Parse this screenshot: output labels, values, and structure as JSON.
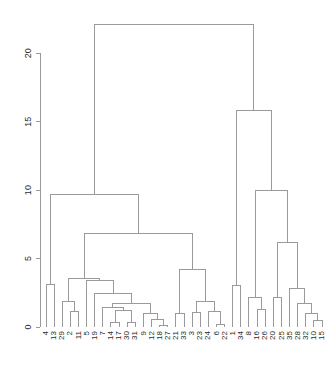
{
  "chart_data": {
    "type": "dendrogram",
    "title": "",
    "subtitle": "",
    "xlabel": "",
    "ylabel": "",
    "grid": false,
    "legend": "none",
    "ylim": [
      0,
      22.5
    ],
    "yticks": [
      0,
      5,
      10,
      15,
      20
    ],
    "ytick_labels": [
      "0",
      "5",
      "10",
      "15",
      "20"
    ],
    "axis_side": "left",
    "label_rotation": -90,
    "line_color": "#9a9a9a",
    "text_color": "#2b2b2b",
    "background": "#ffffff",
    "n_leaves": 35,
    "leaf_order": [
      4,
      13,
      29,
      2,
      11,
      5,
      19,
      7,
      14,
      17,
      30,
      31,
      9,
      12,
      18,
      27,
      21,
      33,
      3,
      23,
      24,
      6,
      22,
      1,
      34,
      8,
      16,
      26,
      20,
      25,
      35,
      28,
      32,
      10,
      15
    ],
    "leaf_labels": [
      "4",
      "13",
      "29",
      "2",
      "11",
      "5",
      "19",
      "7",
      "14",
      "17",
      "30",
      "31",
      "9",
      "12",
      "18",
      "27",
      "21",
      "33",
      "3",
      "23",
      "24",
      "6",
      "22",
      "1",
      "34",
      "8",
      "16",
      "26",
      "20",
      "25",
      "35",
      "28",
      "32",
      "10",
      "15"
    ],
    "merges": [
      {
        "id": "m1",
        "left": {
          "type": "leaf",
          "pos": 0
        },
        "right": {
          "type": "leaf",
          "pos": 1
        },
        "height": 3.1
      },
      {
        "id": "m2",
        "left": {
          "type": "leaf",
          "pos": 3
        },
        "right": {
          "type": "leaf",
          "pos": 4
        },
        "height": 1.15
      },
      {
        "id": "m3",
        "left": {
          "type": "leaf",
          "pos": 2
        },
        "right": {
          "type": "node",
          "ref": "m2"
        },
        "height": 1.85
      },
      {
        "id": "m4",
        "left": {
          "type": "leaf",
          "pos": 8
        },
        "right": {
          "type": "leaf",
          "pos": 9
        },
        "height": 0.35
      },
      {
        "id": "m5",
        "left": {
          "type": "leaf",
          "pos": 10
        },
        "right": {
          "type": "leaf",
          "pos": 11
        },
        "height": 0.3
      },
      {
        "id": "m6",
        "left": {
          "type": "node",
          "ref": "m4"
        },
        "right": {
          "type": "node",
          "ref": "m5"
        },
        "height": 1.2
      },
      {
        "id": "m7",
        "left": {
          "type": "leaf",
          "pos": 7
        },
        "right": {
          "type": "node",
          "ref": "m6"
        },
        "height": 1.45
      },
      {
        "id": "m8",
        "left": {
          "type": "leaf",
          "pos": 14
        },
        "right": {
          "type": "leaf",
          "pos": 15
        },
        "height": 0.1
      },
      {
        "id": "m9",
        "left": {
          "type": "leaf",
          "pos": 13
        },
        "right": {
          "type": "node",
          "ref": "m8"
        },
        "height": 0.55
      },
      {
        "id": "m10",
        "left": {
          "type": "leaf",
          "pos": 12
        },
        "right": {
          "type": "node",
          "ref": "m9"
        },
        "height": 0.95
      },
      {
        "id": "m11",
        "left": {
          "type": "node",
          "ref": "m7"
        },
        "right": {
          "type": "node",
          "ref": "m10"
        },
        "height": 1.7
      },
      {
        "id": "m12",
        "left": {
          "type": "leaf",
          "pos": 6
        },
        "right": {
          "type": "node",
          "ref": "m11"
        },
        "height": 2.45
      },
      {
        "id": "m13",
        "left": {
          "type": "leaf",
          "pos": 5
        },
        "right": {
          "type": "node",
          "ref": "m12"
        },
        "height": 3.4
      },
      {
        "id": "m14",
        "left": {
          "type": "node",
          "ref": "m3"
        },
        "right": {
          "type": "node",
          "ref": "m13"
        },
        "height": 3.55
      },
      {
        "id": "m15",
        "left": {
          "type": "leaf",
          "pos": 16
        },
        "right": {
          "type": "leaf",
          "pos": 17
        },
        "height": 1.0
      },
      {
        "id": "m16",
        "left": {
          "type": "leaf",
          "pos": 18
        },
        "right": {
          "type": "leaf",
          "pos": 19
        },
        "height": 1.05
      },
      {
        "id": "m17",
        "left": {
          "type": "leaf",
          "pos": 21
        },
        "right": {
          "type": "leaf",
          "pos": 22
        },
        "height": 0.15
      },
      {
        "id": "m18",
        "left": {
          "type": "leaf",
          "pos": 20
        },
        "right": {
          "type": "node",
          "ref": "m17"
        },
        "height": 1.1
      },
      {
        "id": "m19",
        "left": {
          "type": "node",
          "ref": "m16"
        },
        "right": {
          "type": "node",
          "ref": "m18"
        },
        "height": 1.85
      },
      {
        "id": "m20",
        "left": {
          "type": "node",
          "ref": "m15"
        },
        "right": {
          "type": "node",
          "ref": "m19"
        },
        "height": 4.2
      },
      {
        "id": "m21",
        "left": {
          "type": "node",
          "ref": "m14"
        },
        "right": {
          "type": "node",
          "ref": "m20"
        },
        "height": 6.8
      },
      {
        "id": "m22",
        "left": {
          "type": "node",
          "ref": "m1"
        },
        "right": {
          "type": "node",
          "ref": "m21"
        },
        "height": 9.65
      },
      {
        "id": "m23",
        "left": {
          "type": "leaf",
          "pos": 23
        },
        "right": {
          "type": "leaf",
          "pos": 24
        },
        "height": 3.0
      },
      {
        "id": "m24",
        "left": {
          "type": "leaf",
          "pos": 26
        },
        "right": {
          "type": "leaf",
          "pos": 27
        },
        "height": 1.25
      },
      {
        "id": "m25",
        "left": {
          "type": "leaf",
          "pos": 25
        },
        "right": {
          "type": "node",
          "ref": "m24"
        },
        "height": 2.15
      },
      {
        "id": "m26",
        "left": {
          "type": "leaf",
          "pos": 28
        },
        "right": {
          "type": "leaf",
          "pos": 29
        },
        "height": 2.15
      },
      {
        "id": "m27",
        "left": {
          "type": "leaf",
          "pos": 33
        },
        "right": {
          "type": "leaf",
          "pos": 34
        },
        "height": 0.45
      },
      {
        "id": "m28",
        "left": {
          "type": "leaf",
          "pos": 32
        },
        "right": {
          "type": "node",
          "ref": "m27"
        },
        "height": 1.0
      },
      {
        "id": "m29",
        "left": {
          "type": "leaf",
          "pos": 31
        },
        "right": {
          "type": "node",
          "ref": "m28"
        },
        "height": 1.75
      },
      {
        "id": "m30",
        "left": {
          "type": "leaf",
          "pos": 30
        },
        "right": {
          "type": "node",
          "ref": "m29"
        },
        "height": 2.8
      },
      {
        "id": "m31",
        "left": {
          "type": "node",
          "ref": "m26"
        },
        "right": {
          "type": "node",
          "ref": "m30"
        },
        "height": 6.15
      },
      {
        "id": "m32",
        "left": {
          "type": "node",
          "ref": "m25"
        },
        "right": {
          "type": "node",
          "ref": "m31"
        },
        "height": 9.95
      },
      {
        "id": "m33",
        "left": {
          "type": "node",
          "ref": "m23"
        },
        "right": {
          "type": "node",
          "ref": "m32"
        },
        "height": 15.8
      },
      {
        "id": "m34",
        "left": {
          "type": "node",
          "ref": "m22"
        },
        "right": {
          "type": "node",
          "ref": "m33"
        },
        "height": 22.1
      }
    ]
  },
  "geometry": {
    "width": 332,
    "height": 392,
    "plot_left": 46,
    "plot_right": 322,
    "axis_x": 40,
    "y_zero": 327,
    "y_top": 19,
    "tick_len": 4,
    "tick_label_gap": 7,
    "leaf_label_gap": 4
  }
}
